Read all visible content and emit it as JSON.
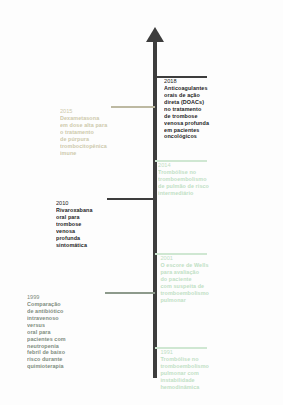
{
  "diagram": {
    "type": "vertical-timeline",
    "orientation": "rotated-90",
    "axis": {
      "name": "timeline-axis",
      "color": "#3d3d3d",
      "arrow_direction": "up"
    },
    "events": [
      {
        "year": "2018",
        "side": "right",
        "tone": "dark",
        "color": "#1d1d1d",
        "top": 76,
        "connector_length": 52,
        "lines": [
          "Anticoagulantes",
          "orais de ação",
          "direta (DOACs)",
          "no tratamento",
          "de trombose",
          "venosa profunda",
          "em pacientes",
          "oncológicos"
        ]
      },
      {
        "year": "2015",
        "side": "left",
        "tone": "khaki",
        "color": "#cdc9ab",
        "top": 106,
        "connector_length": 44,
        "lines": [
          "Dexametasona",
          "em dose alta para",
          "o tratamento",
          "de púrpura",
          "trombocitopênica",
          "imune"
        ]
      },
      {
        "year": "2014",
        "side": "right",
        "tone": "mint",
        "color": "#bfe0c4",
        "top": 160,
        "connector_length": 52,
        "lines": [
          "Trombólise no",
          "tromboembolismo",
          "de pulmão de risco",
          "intermediário"
        ]
      },
      {
        "year": "2010",
        "side": "left",
        "tone": "dark",
        "color": "#1d1d1d",
        "top": 198,
        "connector_length": 48,
        "lines": [
          "Rivaroxabana",
          "oral para",
          "trombose",
          "venosa",
          "profunda",
          "sintomática"
        ]
      },
      {
        "year": "2001",
        "side": "right",
        "tone": "mint",
        "color": "#bfe0c4",
        "top": 253,
        "connector_length": 52,
        "lines": [
          "O escore de Wells",
          "para avaliação",
          "do paciente",
          "com suspeita de",
          "tromboembolismo",
          "pulmonar"
        ]
      },
      {
        "year": "1999",
        "side": "left",
        "tone": "grey",
        "color": "#7e8c7d",
        "top": 292,
        "connector_length": 50,
        "lines": [
          "Comparação",
          "de antibiótico",
          "intravenoso",
          "versus",
          "oral para",
          "pacientes com",
          "neutropenia",
          "febril de baixo",
          "risco durante",
          "quimioterapia"
        ]
      },
      {
        "year": "1991",
        "side": "right",
        "tone": "mint",
        "color": "#bfe0c4",
        "top": 347,
        "connector_length": 52,
        "lines": [
          "Trombólise no",
          "tromboembolismo",
          "pulmonar com",
          "instabilidade",
          "hemodinâmica"
        ]
      }
    ]
  }
}
